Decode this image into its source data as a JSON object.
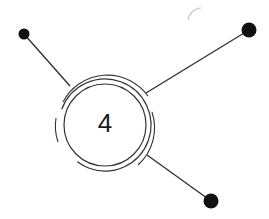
{
  "hub": {
    "label": "4"
  },
  "colors": {
    "stroke": "#2a2a2a",
    "node": "#111111",
    "faint": "#c8c8c8"
  },
  "nodes": [
    {
      "name": "top-left-node"
    },
    {
      "name": "top-right-node"
    },
    {
      "name": "bottom-right-node"
    }
  ]
}
